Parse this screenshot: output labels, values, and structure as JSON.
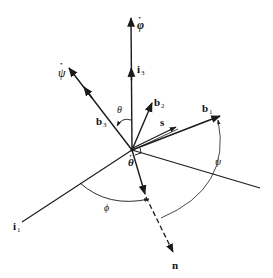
{
  "diagram": {
    "colors": {
      "stroke": "#1a1a1a",
      "background": "#ffffff"
    },
    "labels": {
      "phi_dot": "φ",
      "psi_dot": "ψ",
      "theta_dot": "θ",
      "i3": "i",
      "i3_sub": "3",
      "i1": "i",
      "i1_sub": "1",
      "b1": "b",
      "b1_sub": "1",
      "b2": "b",
      "b2_sub": "2",
      "b3": "b",
      "b3_sub": "3",
      "s": "s",
      "n": "n",
      "theta": "θ",
      "phi": "ϕ",
      "psi": "ψ",
      "dot": "•"
    },
    "vectors": [
      {
        "name": "phi-dot-axis",
        "label": "φ̇"
      },
      {
        "name": "i3-axis",
        "label": "i3"
      },
      {
        "name": "psi-dot-axis",
        "label": "ψ̇"
      },
      {
        "name": "b3-axis",
        "label": "b3"
      },
      {
        "name": "b2-axis",
        "label": "b2"
      },
      {
        "name": "s-vector",
        "label": "s"
      },
      {
        "name": "b1-axis",
        "label": "b1"
      },
      {
        "name": "i1-axis",
        "label": "i1"
      },
      {
        "name": "n-line-of-nodes",
        "label": "n"
      }
    ],
    "angles": [
      {
        "name": "theta-angle",
        "label": "θ",
        "between": [
          "i3",
          "b3"
        ]
      },
      {
        "name": "phi-angle",
        "label": "ϕ",
        "between": [
          "i1",
          "n"
        ]
      },
      {
        "name": "psi-angle",
        "label": "ψ",
        "between": [
          "n",
          "b1"
        ]
      }
    ]
  }
}
